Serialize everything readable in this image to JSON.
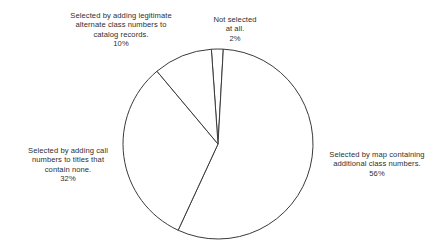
{
  "chart_data": {
    "type": "pie",
    "title": "",
    "subtitle": "",
    "xlabel": "",
    "ylabel": "",
    "legend_position": "none",
    "grid": false,
    "value_unit": "percent",
    "categories": [
      "Not selected at all.",
      "Selected by map containing additional class numbers.",
      "Selected by adding call numbers to titles that contain none.",
      "Selected by adding legitimate alternate class numbers to catalog records."
    ],
    "values": [
      2,
      56,
      32,
      10
    ],
    "slices": [
      {
        "id": "not-selected",
        "label": "Not selected\nat all.",
        "label_line1": "Not selected",
        "label_line2": "at all.",
        "value": 2,
        "value_label": "2%",
        "color": "#ffffff",
        "outline": "#3a3a3a"
      },
      {
        "id": "map-containing",
        "label": "Selected by map containing additional class numbers.",
        "label_line1": "Selected by map containing",
        "label_line2": "additional class numbers.",
        "value": 56,
        "value_label": "56%",
        "color": "#ffffff",
        "outline": "#3a3a3a"
      },
      {
        "id": "call-numbers",
        "label": "Selected by adding call numbers to titles that contain none.",
        "label_line1": "Selected by adding call",
        "label_line2": "numbers to titles that",
        "label_line3": "contain none.",
        "value": 32,
        "value_label": "32%",
        "color": "#ffffff",
        "outline": "#3a3a3a"
      },
      {
        "id": "alternate-class-numbers",
        "label": "Selected by adding legitimate alternate class numbers to catalog records.",
        "label_line1": "Selected by adding legitimate",
        "label_line2": "alternate class numbers to",
        "label_line3": "catalog records.",
        "value": 10,
        "value_label": "10%",
        "color": "#ffffff",
        "outline": "#3a3a3a"
      }
    ],
    "geometry": {
      "center_x": 218,
      "center_y": 144,
      "radius": 95,
      "start_angle_deg": -4
    },
    "background_color": "#ffffff",
    "text_color": "#2f2f2f"
  }
}
